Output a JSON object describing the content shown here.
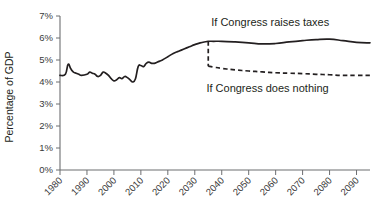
{
  "chart_data": {
    "type": "line",
    "title": "",
    "xlabel": "",
    "ylabel": "Percentage of GDP",
    "xlim": [
      1980,
      2095
    ],
    "ylim": [
      0,
      7
    ],
    "grid": false,
    "legend_position": "inline-annotations",
    "y_tick_labels": [
      "0%",
      "1%",
      "2%",
      "3%",
      "4%",
      "5%",
      "6%",
      "7%"
    ],
    "y_ticks": [
      0,
      1,
      2,
      3,
      4,
      5,
      6,
      7
    ],
    "x_tick_labels": [
      "1980",
      "1990",
      "2000",
      "2010",
      "2020",
      "2030",
      "2040",
      "2050",
      "2060",
      "2070",
      "2080",
      "2090"
    ],
    "x_ticks": [
      1980,
      1990,
      2000,
      2010,
      2020,
      2030,
      2040,
      2050,
      2060,
      2070,
      2080,
      2090
    ],
    "annotations": [
      {
        "name": "raises-taxes-label",
        "text": "If Congress raises taxes",
        "x": 2058,
        "y": 6.55
      },
      {
        "name": "does-nothing-label",
        "text": "If Congress does nothing",
        "x": 2057,
        "y": 3.55
      }
    ],
    "series": [
      {
        "name": "If Congress raises taxes",
        "style": "solid",
        "x": [
          1980,
          1982,
          1983,
          1984,
          1985,
          1986,
          1987,
          1988,
          1990,
          1991,
          1992,
          1993,
          1994,
          1995,
          1996,
          1997,
          1998,
          1999,
          2000,
          2001,
          2002,
          2003,
          2004,
          2005,
          2006,
          2007,
          2008,
          2009,
          2010,
          2011,
          2012,
          2013,
          2014,
          2015,
          2016,
          2017,
          2018,
          2020,
          2022,
          2024,
          2026,
          2028,
          2030,
          2032,
          2034,
          2035,
          2037,
          2040,
          2045,
          2050,
          2055,
          2060,
          2065,
          2070,
          2075,
          2080,
          2085,
          2090,
          2095
        ],
        "y": [
          4.3,
          4.35,
          4.8,
          4.6,
          4.45,
          4.4,
          4.35,
          4.3,
          4.35,
          4.45,
          4.4,
          4.35,
          4.25,
          4.3,
          4.45,
          4.4,
          4.3,
          4.15,
          4.05,
          4.1,
          4.2,
          4.15,
          4.25,
          4.2,
          4.1,
          4.0,
          4.15,
          4.7,
          4.75,
          4.7,
          4.85,
          4.9,
          4.85,
          4.85,
          4.9,
          4.95,
          5.0,
          5.15,
          5.3,
          5.4,
          5.5,
          5.6,
          5.7,
          5.78,
          5.83,
          5.85,
          5.85,
          5.85,
          5.82,
          5.78,
          5.73,
          5.75,
          5.82,
          5.88,
          5.93,
          5.95,
          5.88,
          5.8,
          5.78
        ]
      },
      {
        "name": "If Congress does nothing",
        "style": "dashed",
        "x": [
          2035,
          2035,
          2037,
          2040,
          2045,
          2050,
          2055,
          2060,
          2065,
          2070,
          2075,
          2080,
          2085,
          2090,
          2095
        ],
        "y": [
          5.85,
          4.72,
          4.68,
          4.62,
          4.55,
          4.5,
          4.46,
          4.42,
          4.4,
          4.38,
          4.35,
          4.33,
          4.3,
          4.3,
          4.3
        ]
      }
    ]
  },
  "colors": {
    "line": "#231f20",
    "axis": "#6d6e71",
    "background": "#ffffff"
  }
}
